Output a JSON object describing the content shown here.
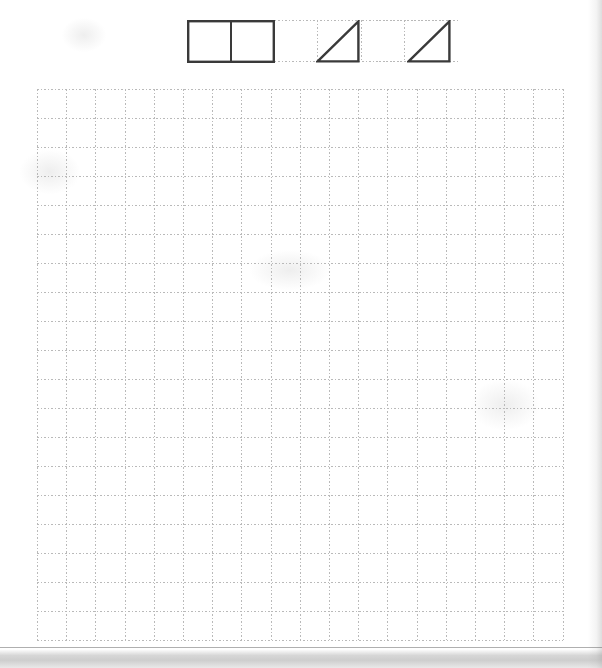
{
  "worksheet": {
    "title": "Grid Worksheet",
    "background_color": "#ffffff",
    "page_width": 602,
    "page_height": 668
  },
  "shapes_strip": {
    "name": "example-shapes-row",
    "description": "Three pre-drawn example figures on a faint dotted grid",
    "faint_grid": {
      "left": 187,
      "top": 20,
      "width": 272,
      "height": 42,
      "cell_width": 43.5,
      "cell_height": 42,
      "columns": 6,
      "rows": 1,
      "line_color": "#c9c9c9"
    },
    "stroke_color": "#3a3a3a",
    "stroke_width": 2.4,
    "shapes": [
      {
        "id": "shape-rectangle",
        "label": "rectangle",
        "type": "rectangle",
        "cells_wide": 2,
        "cells_tall": 1,
        "left": 187,
        "top": 20,
        "width": 87,
        "height": 42,
        "has_middle_divider": true,
        "divider_x": 44
      },
      {
        "id": "shape-triangle-1",
        "label": "right triangle",
        "type": "right-triangle",
        "cells_wide": 1,
        "cells_tall": 1,
        "left": 316,
        "top": 20,
        "width": 43,
        "height": 42,
        "right_angle_corner": "bottom-right",
        "hypotenuse": "bottom-left to top-right"
      },
      {
        "id": "shape-triangle-2",
        "label": "right triangle",
        "type": "right-triangle",
        "cells_wide": 1,
        "cells_tall": 1,
        "left": 407,
        "top": 20,
        "width": 43,
        "height": 42,
        "right_angle_corner": "bottom-right",
        "hypotenuse": "bottom-left to top-right"
      }
    ]
  },
  "main_grid": {
    "name": "answer-grid",
    "left": 37,
    "top": 89,
    "columns": 18,
    "rows": 19,
    "cell_width": 29.2,
    "cell_height": 29.0,
    "width": 525,
    "height": 551,
    "line_color": "#b9b9b9",
    "line_style": "dotted",
    "line_width": 1
  },
  "artifacts": {
    "right_edge_shadow": "#8c8c8c",
    "bottom_edge_shadow": "#787878",
    "smudges": [
      {
        "left": 20,
        "top": 150,
        "width": 60,
        "height": 44
      },
      {
        "left": 62,
        "top": 18,
        "width": 44,
        "height": 34
      },
      {
        "left": 470,
        "top": 380,
        "width": 70,
        "height": 50
      },
      {
        "left": 250,
        "top": 250,
        "width": 80,
        "height": 40
      }
    ]
  }
}
